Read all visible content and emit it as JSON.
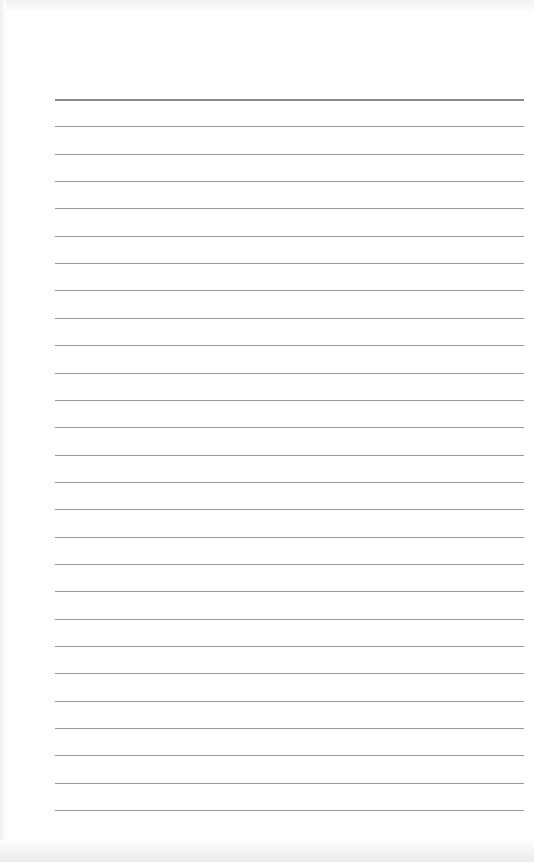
{
  "document": {
    "type": "lined-paper",
    "text": "",
    "line_count": 27,
    "first_line_y": 99,
    "line_spacing": 27.35,
    "line_left": 55,
    "line_right": 524,
    "colors": {
      "paper": "#fefefe",
      "rule": "#9a9a9a",
      "first_rule": "#8a8a8a"
    }
  }
}
